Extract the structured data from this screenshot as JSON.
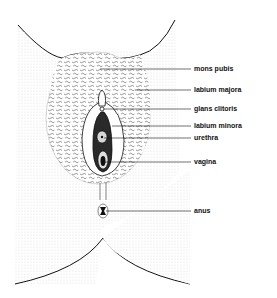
{
  "diagram": {
    "type": "anatomical illustration",
    "labels": [
      {
        "id": "mons-pubis",
        "text": "mons pubis",
        "x": 194,
        "y": 65,
        "target": [
          100,
          69
        ]
      },
      {
        "id": "labium-majora",
        "text": "labium majora",
        "x": 194,
        "y": 86,
        "target": [
          135,
          90
        ]
      },
      {
        "id": "glans-clitoris",
        "text": "glans clitoris",
        "x": 194,
        "y": 105,
        "target": [
          103,
          109
        ]
      },
      {
        "id": "labium-minora",
        "text": "labium minora",
        "x": 194,
        "y": 122,
        "target": [
          112,
          126
        ]
      },
      {
        "id": "urethra",
        "text": "urethra",
        "x": 194,
        "y": 134,
        "target": [
          103,
          138
        ]
      },
      {
        "id": "vagina",
        "text": "vagina",
        "x": 194,
        "y": 158,
        "target": [
          105,
          162
        ]
      },
      {
        "id": "anus",
        "text": "anus",
        "x": 194,
        "y": 207,
        "target": [
          105,
          211
        ]
      }
    ]
  }
}
